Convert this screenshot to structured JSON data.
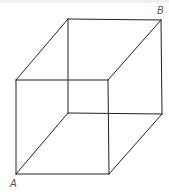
{
  "figure": {
    "type": "wireframe-cube",
    "stroke_color": "#222222",
    "label_color": "#555555",
    "vertices": {
      "front_top_left": [
        16,
        80
      ],
      "front_top_right": [
        108,
        80
      ],
      "front_bottom_left": [
        16,
        174
      ],
      "front_bottom_right": [
        109,
        174
      ],
      "back_top_left": [
        68,
        19
      ],
      "back_top_right": [
        161,
        20
      ],
      "back_bottom_left": [
        68,
        113
      ],
      "back_bottom_right": [
        162,
        114
      ]
    },
    "labels": {
      "A": "A",
      "B": "B"
    }
  }
}
